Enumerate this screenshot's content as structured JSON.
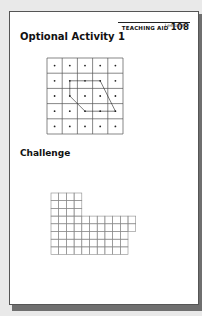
{
  "header": {
    "teaching_aid_label": "TEACHING AID",
    "teaching_aid_number": "108",
    "lesson": "Lesson 8-3"
  },
  "sections": [
    {
      "title": "Optional Activity 1",
      "figure": {
        "type": "dot-grid",
        "rows": 5,
        "cols": 5,
        "polygon_vertices_col_row": [
          [
            1,
            1
          ],
          [
            3,
            1
          ],
          [
            4,
            3
          ],
          [
            2,
            3
          ],
          [
            1,
            2
          ]
        ]
      }
    },
    {
      "title": "Challenge",
      "figure": {
        "type": "square-grid-shape",
        "row_widths_cells": [
          4,
          4,
          4,
          11,
          11,
          10,
          10,
          10
        ]
      }
    }
  ]
}
